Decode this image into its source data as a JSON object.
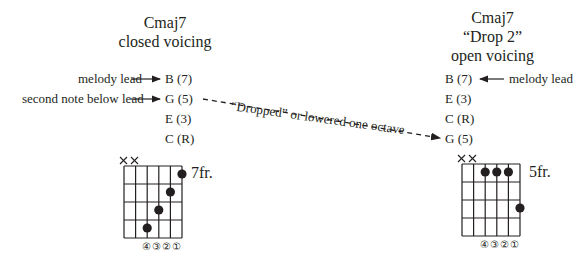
{
  "left": {
    "title_line1": "Cmaj7",
    "title_line2": "closed voicing",
    "notes": [
      "B (7)",
      "G (5)",
      "E (3)",
      "C (R)"
    ],
    "annotations": {
      "melody_lead": "melody lead",
      "second_note": "second note below lead"
    },
    "fret_label": "7fr.",
    "muted_strings": [
      "6",
      "5"
    ],
    "dots": [
      {
        "string": 1,
        "fret": 1
      },
      {
        "string": 2,
        "fret": 2
      },
      {
        "string": 3,
        "fret": 3
      },
      {
        "string": 4,
        "fret": 4
      }
    ],
    "string_numbers": "④③②①"
  },
  "right": {
    "title_line1": "Cmaj7",
    "title_line2": "“Drop 2”",
    "title_line3": "open voicing",
    "notes": [
      "B (7)",
      "E (3)",
      "C (R)",
      "G (5)"
    ],
    "annotations": {
      "melody_lead": "melody lead"
    },
    "fret_label": "5fr.",
    "muted_strings": [
      "6",
      "5"
    ],
    "dots": [
      {
        "string": 4,
        "fret": 1
      },
      {
        "string": 3,
        "fret": 1
      },
      {
        "string": 2,
        "fret": 1
      },
      {
        "string": 1,
        "fret": 3
      }
    ],
    "string_numbers": "④③②①"
  },
  "connector": {
    "label": "“Dropped” or lowered one octave",
    "style": "dashed-arrow"
  },
  "colors": {
    "ink": "#231f20",
    "background": "#ffffff"
  }
}
